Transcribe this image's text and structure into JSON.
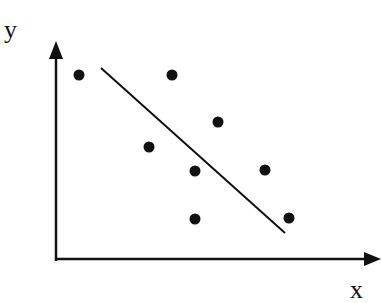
{
  "chart_data": {
    "type": "scatter",
    "title": "",
    "xlabel": "x",
    "ylabel": "y",
    "xlim": [
      0,
      32.2
    ],
    "ylim": [
      0,
      21.4
    ],
    "grid": false,
    "legend": "none",
    "ticks": false,
    "points": [
      {
        "x": 2.3,
        "y": 18.4
      },
      {
        "x": 11.6,
        "y": 18.4
      },
      {
        "x": 16.2,
        "y": 13.7
      },
      {
        "x": 9.3,
        "y": 11.2
      },
      {
        "x": 13.9,
        "y": 8.8
      },
      {
        "x": 20.9,
        "y": 8.9
      },
      {
        "x": 13.9,
        "y": 4.0
      },
      {
        "x": 23.3,
        "y": 4.1
      }
    ],
    "trend_line": {
      "start": {
        "x": 4.5,
        "y": 19.1
      },
      "end": {
        "x": 22.9,
        "y": 2.6
      }
    },
    "colors": {
      "ink": "#111111",
      "background": "#ffffff"
    }
  }
}
